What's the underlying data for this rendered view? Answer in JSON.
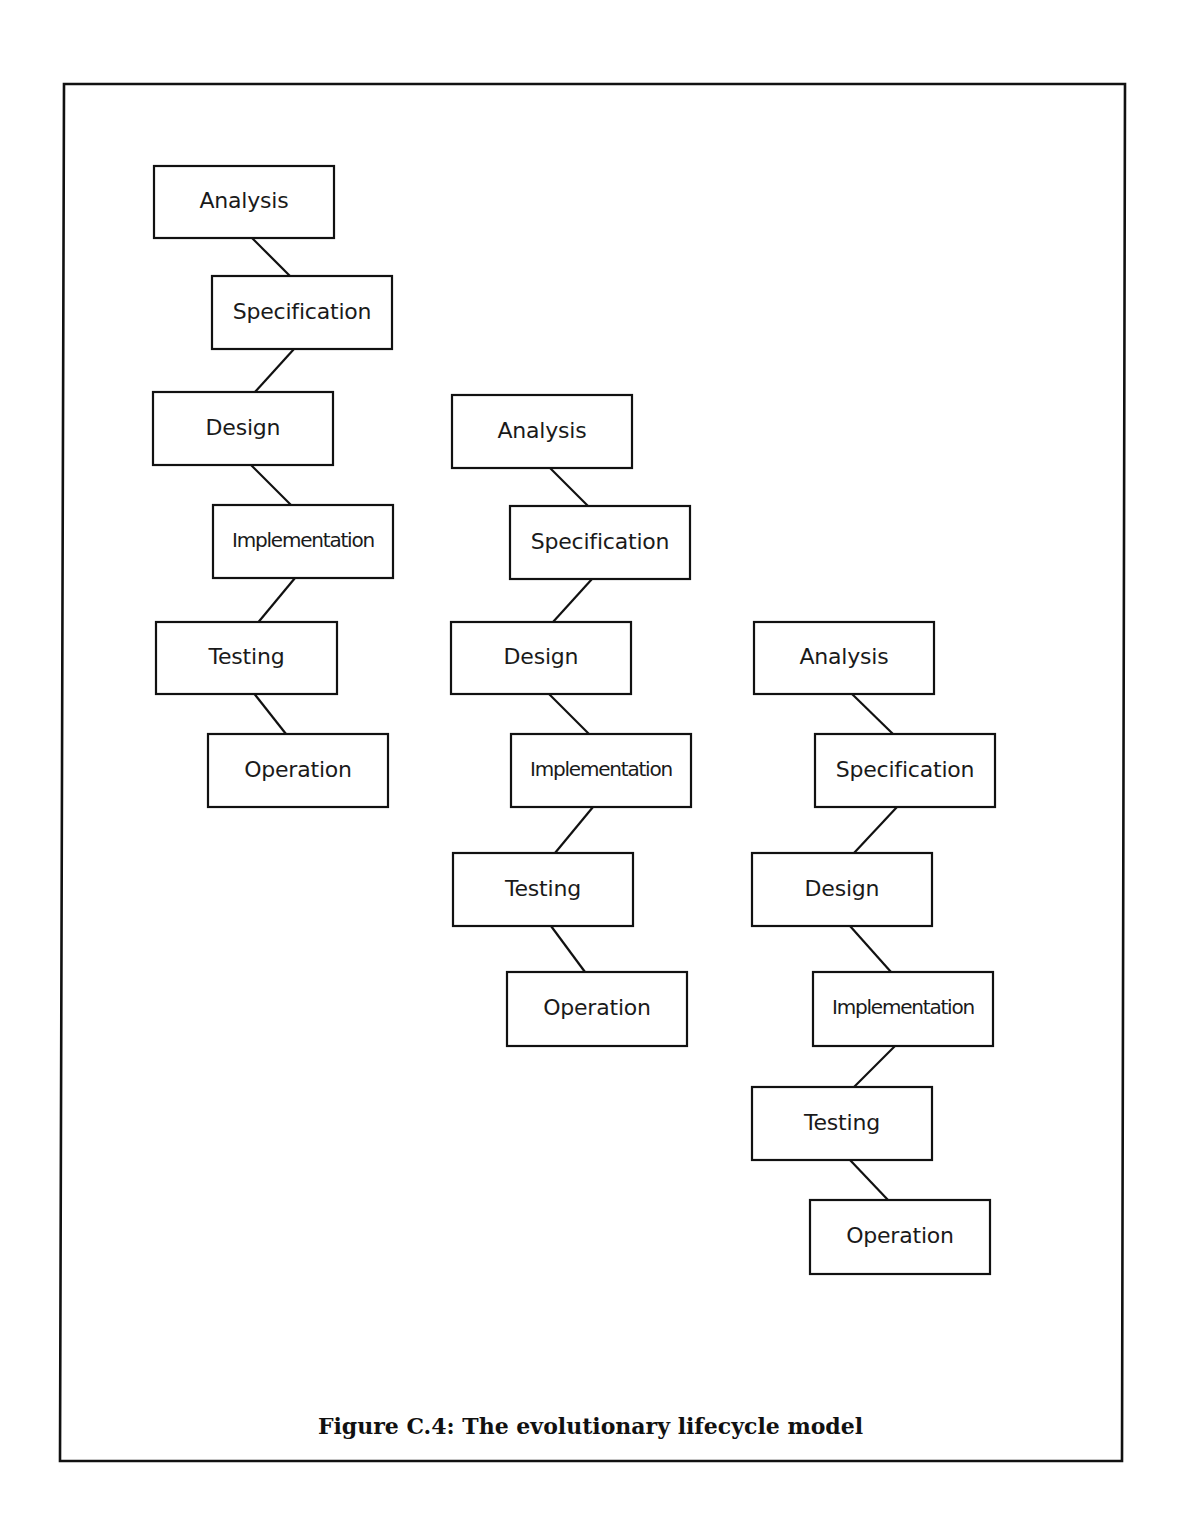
{
  "figure": {
    "caption": "Figure C.4: The evolutionary lifecycle model"
  },
  "colors": {
    "stroke": "#111111",
    "background": "#ffffff"
  },
  "frame": {
    "x1": 64,
    "y1": 84,
    "x2": 1122,
    "y2": 1461
  },
  "columns": [
    {
      "name": "iteration-1",
      "steps": [
        {
          "label": "Analysis",
          "box": [
            154,
            166,
            334,
            238
          ]
        },
        {
          "label": "Specification",
          "box": [
            212,
            276,
            392,
            349
          ]
        },
        {
          "label": "Design",
          "box": [
            153,
            392,
            333,
            465
          ]
        },
        {
          "label": "Implementation",
          "box": [
            213,
            505,
            393,
            578
          ]
        },
        {
          "label": "Testing",
          "box": [
            156,
            622,
            337,
            694
          ]
        },
        {
          "label": "Operation",
          "box": [
            208,
            734,
            388,
            807
          ]
        }
      ]
    },
    {
      "name": "iteration-2",
      "steps": [
        {
          "label": "Analysis",
          "box": [
            452,
            395,
            632,
            468
          ]
        },
        {
          "label": "Specification",
          "box": [
            510,
            506,
            690,
            579
          ]
        },
        {
          "label": "Design",
          "box": [
            451,
            622,
            631,
            694
          ]
        },
        {
          "label": "Implementation",
          "box": [
            511,
            734,
            691,
            807
          ]
        },
        {
          "label": "Testing",
          "box": [
            453,
            853,
            633,
            926
          ]
        },
        {
          "label": "Operation",
          "box": [
            507,
            972,
            687,
            1046
          ]
        }
      ]
    },
    {
      "name": "iteration-3",
      "steps": [
        {
          "label": "Analysis",
          "box": [
            754,
            622,
            934,
            694
          ]
        },
        {
          "label": "Specification",
          "box": [
            815,
            734,
            995,
            807
          ]
        },
        {
          "label": "Design",
          "box": [
            752,
            853,
            932,
            926
          ]
        },
        {
          "label": "Implementation",
          "box": [
            813,
            972,
            993,
            1046
          ]
        },
        {
          "label": "Testing",
          "box": [
            752,
            1087,
            932,
            1160
          ]
        },
        {
          "label": "Operation",
          "box": [
            810,
            1200,
            990,
            1274
          ]
        }
      ]
    }
  ]
}
